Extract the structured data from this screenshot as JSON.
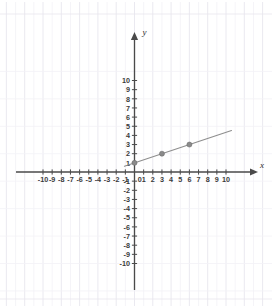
{
  "chart_data": {
    "type": "line",
    "title": "",
    "subtitle": "",
    "xlabel": "x",
    "ylabel": "y",
    "xlim": [
      -10,
      10
    ],
    "ylim": [
      -10,
      10
    ],
    "grid": true,
    "legend": "none",
    "x_ticks": [
      -10,
      -9,
      -8,
      -7,
      -6,
      -5,
      -4,
      -3,
      -2,
      -1,
      0,
      1,
      2,
      3,
      4,
      5,
      6,
      7,
      8,
      9,
      10
    ],
    "y_ticks": [
      10,
      9,
      8,
      7,
      6,
      5,
      4,
      3,
      2,
      1,
      -1,
      -2,
      -3,
      -4,
      -5,
      -6,
      -7,
      -8,
      -9,
      -10
    ],
    "x_tick_labels": [
      "-10",
      "-9",
      "-8",
      "-7",
      "-6",
      "-5",
      "-4",
      "-3",
      "-2",
      "-1",
      "0",
      "1",
      "2",
      "3",
      "4",
      "5",
      "6",
      "7",
      "8",
      "9",
      "10"
    ],
    "y_tick_labels": [
      "10",
      "9",
      "8",
      "7",
      "6",
      "5",
      "4",
      "3",
      "2",
      "1",
      "-1",
      "-2",
      "-3",
      "-4",
      "-5",
      "-6",
      "-7",
      "-8",
      "-9",
      "-10"
    ],
    "origin_label": "0",
    "series": [
      {
        "name": "line",
        "slope": 0.3333333,
        "intercept": 1,
        "line_start": [
          -1.1,
          0.633
        ],
        "line_end": [
          10.6,
          4.533
        ],
        "points": [
          {
            "x": 0,
            "y": 1
          },
          {
            "x": 3,
            "y": 2
          },
          {
            "x": 6,
            "y": 3
          }
        ]
      }
    ],
    "colors": {
      "axis": "#4a4a4a",
      "grid": "#e8e6ee",
      "grid_minor": "#f2f1f6",
      "line": "#8e8e8e",
      "point": "#8a8a8a",
      "point_stroke": "#6f6f6f",
      "tick_text": "#3a3a3a",
      "background": "#ffffff"
    }
  },
  "axis_labels": {
    "x": "x",
    "y": "y"
  }
}
